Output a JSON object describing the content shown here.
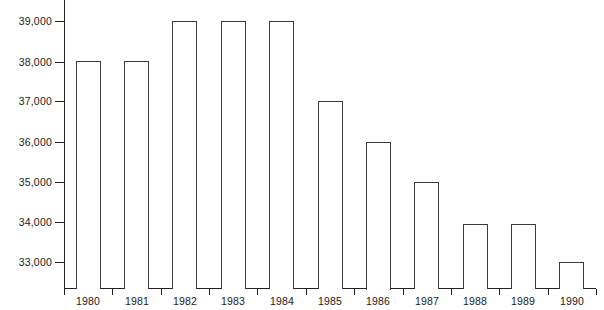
{
  "chart_data": {
    "type": "bar",
    "title": "",
    "subtitle": "",
    "xlabel": "",
    "ylabel": "",
    "categories": [
      "1980",
      "1981",
      "1982",
      "1983",
      "1984",
      "1985",
      "1986",
      "1987",
      "1988",
      "1989",
      "1990"
    ],
    "values": [
      38000,
      38000,
      39000,
      39000,
      39000,
      37000,
      36000,
      35000,
      33950,
      33950,
      33000
    ],
    "series": [
      {
        "name": "",
        "values": [
          38000,
          38000,
          39000,
          39000,
          39000,
          37000,
          36000,
          35000,
          33950,
          33950,
          33000
        ]
      }
    ],
    "ylim": [
      32280,
      39500
    ],
    "ytick_labels": [
      "39,000",
      "38,000",
      "37,000",
      "36,000",
      "35,000",
      "34,000",
      "33,000"
    ],
    "ytick_values": [
      39000,
      38000,
      37000,
      36000,
      35000,
      34000,
      33000
    ],
    "grid": false,
    "legend": false,
    "legend_position": "none",
    "bar_fill_color": "#ffffff",
    "bar_edge_color": "#3a3a3a",
    "axis_color": "#222222",
    "background_color": "#ffffff"
  }
}
